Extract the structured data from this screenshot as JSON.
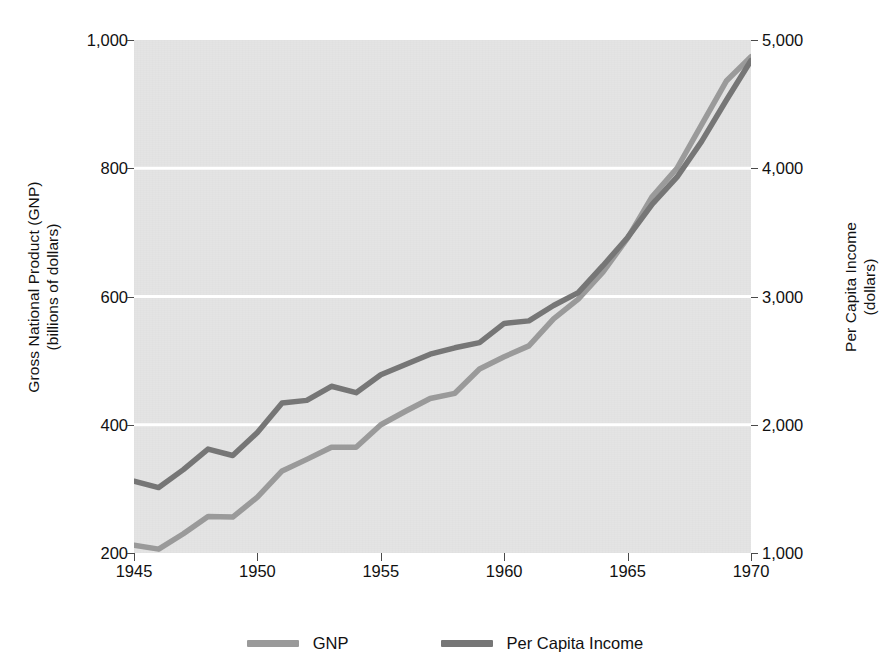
{
  "chart_data": {
    "type": "line",
    "title": "",
    "xlabel": "",
    "x": [
      1945,
      1946,
      1947,
      1948,
      1949,
      1950,
      1951,
      1952,
      1953,
      1954,
      1955,
      1956,
      1957,
      1958,
      1959,
      1960,
      1961,
      1962,
      1963,
      1964,
      1965,
      1966,
      1967,
      1968,
      1969,
      1970
    ],
    "xlim": [
      1945,
      1970
    ],
    "xticks": [
      "1945",
      "1950",
      "1955",
      "1960",
      "1965",
      "1970"
    ],
    "xtick_values": [
      1945,
      1950,
      1955,
      1960,
      1965,
      1970
    ],
    "grid": "horizontal-white",
    "legend_position": "bottom-center",
    "plot_background": "#e4e4e4",
    "series": [
      {
        "name": "GNP",
        "color": "#9a9a9a",
        "axis": "left",
        "axis_label": "Gross National Product (GNP)",
        "axis_units": "(billions of dollars)",
        "ylim": [
          200,
          1000
        ],
        "yticks": [
          "200",
          "400",
          "600",
          "800",
          "1,000"
        ],
        "ytick_values": [
          200,
          400,
          600,
          800,
          1000
        ],
        "values": [
          212,
          206,
          230,
          257,
          256,
          287,
          328,
          346,
          365,
          365,
          400,
          421,
          441,
          449,
          487,
          506,
          523,
          565,
          596,
          638,
          691,
          756,
          800,
          868,
          936,
          974
        ]
      },
      {
        "name": "Per Capita Income",
        "color": "#767676",
        "axis": "right",
        "axis_label": "Per Capita Income",
        "axis_units": "(dollars)",
        "ylim": [
          1000,
          5000
        ],
        "yticks": [
          "1,000",
          "2,000",
          "3,000",
          "4,000",
          "5,000"
        ],
        "ytick_values": [
          1000,
          2000,
          3000,
          4000,
          5000
        ],
        "values": [
          1560,
          1510,
          1650,
          1810,
          1760,
          1940,
          2170,
          2190,
          2300,
          2250,
          2390,
          2470,
          2550,
          2600,
          2640,
          2790,
          2810,
          2930,
          3030,
          3240,
          3460,
          3720,
          3930,
          4210,
          4530,
          4840
        ]
      }
    ]
  },
  "axes": {
    "left": {
      "title_line1": "Gross National Product (GNP)",
      "title_line2": "(billions of dollars)",
      "ticks": [
        "1,000",
        "800",
        "600",
        "400",
        "200"
      ]
    },
    "right": {
      "title_line1": "Per Capita Income",
      "title_line2": "(dollars)",
      "ticks": [
        "5,000",
        "4,000",
        "3,000",
        "2,000",
        "1,000"
      ]
    },
    "bottom": {
      "ticks": [
        "1945",
        "1950",
        "1955",
        "1960",
        "1965",
        "1970"
      ]
    }
  },
  "legend": {
    "items": [
      {
        "label": "GNP",
        "color": "#9a9a9a"
      },
      {
        "label": "Per Capita Income",
        "color": "#767676"
      }
    ]
  }
}
